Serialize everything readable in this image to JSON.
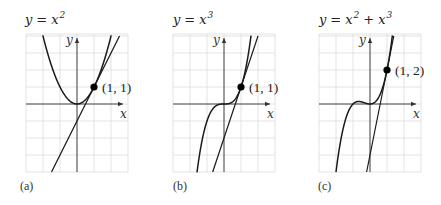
{
  "figure": {
    "background": "#ffffff",
    "grid_color": "#dcdcdc",
    "curve_color": "#1a1a1a",
    "panels": [
      {
        "id": "a",
        "label": "(a)",
        "title": {
          "lhs": "y",
          "eq": "=",
          "terms": [
            {
              "base": "x",
              "exp": "2"
            }
          ]
        },
        "function": "x^2",
        "tangent": {
          "slope": 2,
          "intercept": -1
        },
        "point": {
          "x": 1,
          "y": 1,
          "label": "(1, 1)"
        },
        "axis_labels": {
          "x": "x",
          "y": "y"
        },
        "origin_px": [
          77,
          104
        ],
        "unit_px": 17,
        "xrange": [
          -3,
          3
        ],
        "yrange": [
          -4,
          4
        ]
      },
      {
        "id": "b",
        "label": "(b)",
        "title": {
          "lhs": "y",
          "eq": "=",
          "terms": [
            {
              "base": "x",
              "exp": "3"
            }
          ]
        },
        "function": "x^3",
        "tangent": {
          "slope": 3,
          "intercept": -2
        },
        "point": {
          "x": 1,
          "y": 1,
          "label": "(1, 1)"
        },
        "axis_labels": {
          "x": "x",
          "y": "y"
        },
        "origin_px": [
          224,
          104
        ],
        "unit_px": 17,
        "xrange": [
          -3,
          3
        ],
        "yrange": [
          -4,
          4
        ]
      },
      {
        "id": "c",
        "label": "(c)",
        "title": {
          "lhs": "y",
          "eq": "=",
          "terms": [
            {
              "base": "x",
              "exp": "2"
            },
            {
              "op": "+"
            },
            {
              "base": "x",
              "exp": "3"
            }
          ]
        },
        "function": "x^2 + x^3",
        "tangent": {
          "slope": 5,
          "intercept": -3
        },
        "point": {
          "x": 1,
          "y": 2,
          "label": "(1, 2)"
        },
        "axis_labels": {
          "x": "x",
          "y": "y"
        },
        "origin_px": [
          370,
          104
        ],
        "unit_px": 17,
        "xrange": [
          -3,
          3
        ],
        "yrange": [
          -4,
          4
        ]
      }
    ]
  }
}
